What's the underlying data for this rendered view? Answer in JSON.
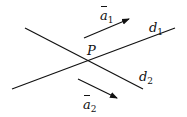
{
  "diagram": {
    "point": {
      "label": "P"
    },
    "lines": [
      {
        "id": "d1",
        "label": "d",
        "sub": "1"
      },
      {
        "id": "d2",
        "label": "d",
        "sub": "2"
      }
    ],
    "vectors": [
      {
        "id": "a1",
        "label": "a",
        "sub": "1",
        "overbar": true
      },
      {
        "id": "a2",
        "label": "a",
        "sub": "2",
        "overbar": true
      }
    ],
    "colors": {
      "stroke": "#111111",
      "background": "#ffffff"
    }
  }
}
